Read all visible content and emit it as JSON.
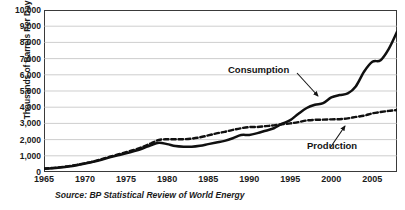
{
  "chart_data": {
    "type": "line",
    "title": "",
    "xlabel": "",
    "ylabel": "Thousands of Barrels Per Day",
    "source": "Source: BP Statistical Review of World Energy",
    "grid": "horizontal",
    "legend_position": "inline-annotations",
    "xlim": [
      1965,
      2008
    ],
    "ylim": [
      0,
      10000
    ],
    "ytick_labels": [
      "10,000",
      "9,000",
      "8,000",
      "7,000",
      "6,000",
      "5,000",
      "4,000",
      "3,000",
      "2,000",
      "1,000",
      "0"
    ],
    "ytick_values": [
      10000,
      9000,
      8000,
      7000,
      6000,
      5000,
      4000,
      3000,
      2000,
      1000,
      0
    ],
    "xtick_labels": [
      "1965",
      "1970",
      "1975",
      "1980",
      "1985",
      "1990",
      "1995",
      "2000",
      "2005"
    ],
    "xtick_values": [
      1965,
      1970,
      1975,
      1980,
      1985,
      1990,
      1995,
      2000,
      2005
    ],
    "x": [
      1965,
      1966,
      1967,
      1968,
      1969,
      1970,
      1971,
      1972,
      1973,
      1974,
      1975,
      1976,
      1977,
      1978,
      1979,
      1980,
      1981,
      1982,
      1983,
      1984,
      1985,
      1986,
      1987,
      1988,
      1989,
      1990,
      1991,
      1992,
      1993,
      1994,
      1995,
      1996,
      1997,
      1998,
      1999,
      2000,
      2001,
      2002,
      2003,
      2004,
      2005,
      2006,
      2007,
      2008
    ],
    "series": [
      {
        "name": "Consumption",
        "style": "solid",
        "color": "#101010",
        "values": [
          200,
          230,
          280,
          340,
          420,
          520,
          630,
          760,
          900,
          1030,
          1150,
          1290,
          1450,
          1650,
          1800,
          1720,
          1600,
          1560,
          1560,
          1620,
          1720,
          1820,
          1920,
          2080,
          2280,
          2290,
          2400,
          2550,
          2700,
          2980,
          3200,
          3600,
          3950,
          4150,
          4250,
          4600,
          4750,
          4850,
          5300,
          6200,
          6800,
          6900,
          7600,
          8650
        ]
      },
      {
        "name": "Production",
        "style": "dashed",
        "color": "#101010",
        "values": [
          220,
          250,
          300,
          360,
          440,
          540,
          650,
          790,
          940,
          1080,
          1220,
          1370,
          1550,
          1760,
          1980,
          2020,
          2020,
          2020,
          2060,
          2140,
          2260,
          2380,
          2480,
          2600,
          2700,
          2770,
          2780,
          2830,
          2880,
          2950,
          3000,
          3080,
          3180,
          3220,
          3230,
          3250,
          3260,
          3310,
          3400,
          3480,
          3620,
          3700,
          3770,
          3820
        ]
      }
    ],
    "annotations": [
      {
        "id": "consumption",
        "label": "Consumption",
        "points_to_series": "Consumption",
        "arrow": "down-right"
      },
      {
        "id": "production",
        "label": "Production",
        "points_to_series": "Production",
        "arrow": "up-right"
      }
    ]
  },
  "axes": {
    "y_title": "Thousands of Barrels Per Day"
  },
  "labels": {
    "consumption": "Consumption",
    "production": "Production"
  },
  "footer": {
    "source": "Source: BP Statistical Review of World Energy"
  }
}
